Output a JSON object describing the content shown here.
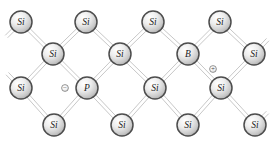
{
  "diagram": {
    "background_color": "#ffffff",
    "bond_color": "#b9b9b9",
    "atom_outline_color": "#4d4d4d",
    "atom_fill_light": "#fbfbfb",
    "atom_fill_dark": "#9a9a9a",
    "label_color": "#1a1a1a",
    "atom_radius": 11,
    "width": 275,
    "height": 141,
    "atoms": [
      {
        "id": "si-r1-c1",
        "label": "Si",
        "element": "Si",
        "x": 21,
        "y": 22,
        "row": 1,
        "col": 1
      },
      {
        "id": "si-r1-c2",
        "label": "Si",
        "element": "Si",
        "x": 86,
        "y": 22,
        "row": 1,
        "col": 2
      },
      {
        "id": "si-r1-c3",
        "label": "Si",
        "element": "Si",
        "x": 153,
        "y": 22,
        "row": 1,
        "col": 3
      },
      {
        "id": "si-r1-c4",
        "label": "Si",
        "element": "Si",
        "x": 220,
        "y": 22,
        "row": 1,
        "col": 4
      },
      {
        "id": "si-r2-c1",
        "label": "Si",
        "element": "Si",
        "x": 53,
        "y": 54,
        "row": 2,
        "col": 1
      },
      {
        "id": "si-r2-c2",
        "label": "Si",
        "element": "Si",
        "x": 120,
        "y": 54,
        "row": 2,
        "col": 2
      },
      {
        "id": "b-r2-c3",
        "label": "B",
        "element": "B",
        "x": 188,
        "y": 54,
        "row": 2,
        "col": 3
      },
      {
        "id": "si-r2-c4",
        "label": "Si",
        "element": "Si",
        "x": 254,
        "y": 54,
        "row": 2,
        "col": 4
      },
      {
        "id": "si-r3-c1",
        "label": "Si",
        "element": "Si",
        "x": 21,
        "y": 88,
        "row": 3,
        "col": 1
      },
      {
        "id": "p-r3-c2",
        "label": "P",
        "element": "P",
        "x": 87,
        "y": 88,
        "row": 3,
        "col": 2
      },
      {
        "id": "si-r3-c3",
        "label": "Si",
        "element": "Si",
        "x": 155,
        "y": 88,
        "row": 3,
        "col": 3
      },
      {
        "id": "si-r3-c4",
        "label": "Si",
        "element": "Si",
        "x": 221,
        "y": 88,
        "row": 3,
        "col": 4
      },
      {
        "id": "si-r4-c1",
        "label": "Si",
        "element": "Si",
        "x": 54,
        "y": 125,
        "row": 4,
        "col": 1
      },
      {
        "id": "si-r4-c2",
        "label": "Si",
        "element": "Si",
        "x": 122,
        "y": 125,
        "row": 4,
        "col": 2
      },
      {
        "id": "si-r4-c3",
        "label": "Si",
        "element": "Si",
        "x": 188,
        "y": 125,
        "row": 4,
        "col": 3
      },
      {
        "id": "si-r4-c4",
        "label": "Si",
        "element": "Si",
        "x": 255,
        "y": 125,
        "row": 4,
        "col": 4
      }
    ],
    "bonds": [
      {
        "from": "si-r1-c1",
        "to": "si-r2-c1"
      },
      {
        "from": "si-r1-c2",
        "to": "si-r2-c1"
      },
      {
        "from": "si-r1-c2",
        "to": "si-r2-c2"
      },
      {
        "from": "si-r1-c3",
        "to": "si-r2-c2"
      },
      {
        "from": "si-r1-c3",
        "to": "b-r2-c3"
      },
      {
        "from": "si-r1-c4",
        "to": "b-r2-c3"
      },
      {
        "from": "si-r1-c4",
        "to": "si-r2-c4"
      },
      {
        "from": "si-r2-c1",
        "to": "si-r3-c1"
      },
      {
        "from": "si-r2-c1",
        "to": "p-r3-c2"
      },
      {
        "from": "si-r2-c2",
        "to": "p-r3-c2"
      },
      {
        "from": "si-r2-c2",
        "to": "si-r3-c3"
      },
      {
        "from": "b-r2-c3",
        "to": "si-r3-c3"
      },
      {
        "from": "b-r2-c3",
        "to": "si-r3-c4"
      },
      {
        "from": "si-r2-c4",
        "to": "si-r3-c4"
      },
      {
        "from": "si-r3-c1",
        "to": "si-r4-c1"
      },
      {
        "from": "p-r3-c2",
        "to": "si-r4-c1"
      },
      {
        "from": "p-r3-c2",
        "to": "si-r4-c2"
      },
      {
        "from": "si-r3-c3",
        "to": "si-r4-c2"
      },
      {
        "from": "si-r3-c3",
        "to": "si-r4-c3"
      },
      {
        "from": "si-r3-c4",
        "to": "si-r4-c3"
      },
      {
        "from": "si-r3-c4",
        "to": "si-r4-c4"
      }
    ],
    "edge_bonds": [
      {
        "from": "si-r1-c1",
        "dx": -22,
        "dy": 22
      },
      {
        "from": "si-r1-c2",
        "dx": 0,
        "dy": 0
      },
      {
        "from": "si-r2-c4",
        "dx": 21,
        "dy": -22
      },
      {
        "from": "si-r3-c1",
        "dx": -21,
        "dy": -22
      },
      {
        "from": "si-r4-c4",
        "dx": 20,
        "dy": -20
      }
    ],
    "charges": [
      {
        "id": "electron-charge",
        "symbol": "⊖",
        "name": "free-electron",
        "x": 65,
        "y": 88
      },
      {
        "id": "hole-charge",
        "symbol": "⊕",
        "name": "hole",
        "x": 213,
        "y": 69
      }
    ]
  }
}
